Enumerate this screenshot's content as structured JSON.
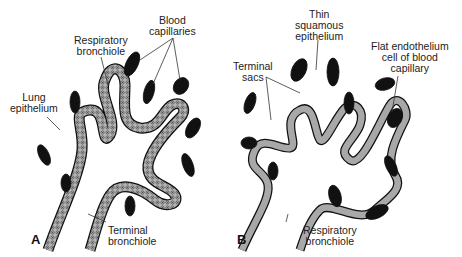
{
  "figure": {
    "panels": [
      {
        "letter": "A",
        "labels": {
          "blood_capillaries_1": "Blood",
          "blood_capillaries_2": "capillaries",
          "respiratory_bronchiole_1": "Respiratory",
          "respiratory_bronchiole_2": "bronchiole",
          "lung_epithelium_1": "Lung",
          "lung_epithelium_2": "epithelium",
          "terminal_bronchiole_1": "Terminal",
          "terminal_bronchiole_2": "bronchiole"
        }
      },
      {
        "letter": "B",
        "labels": {
          "thin_squamous_1": "Thin",
          "thin_squamous_2": "squamous",
          "thin_squamous_3": "epithelium",
          "flat_endothelium_1": "Flat endothelium",
          "flat_endothelium_2": "cell of blood",
          "flat_endothelium_3": "capillary",
          "terminal_sacs_1": "Terminal",
          "terminal_sacs_2": "sacs",
          "respiratory_bronchiole_1": "Respiratory",
          "respiratory_bronchiole_2": "bronchiole"
        }
      }
    ],
    "colors": {
      "ink": "#111111",
      "epithelium_fill": "#9a9a9a",
      "capillary_fill": "#111111",
      "label": "#222222"
    }
  }
}
